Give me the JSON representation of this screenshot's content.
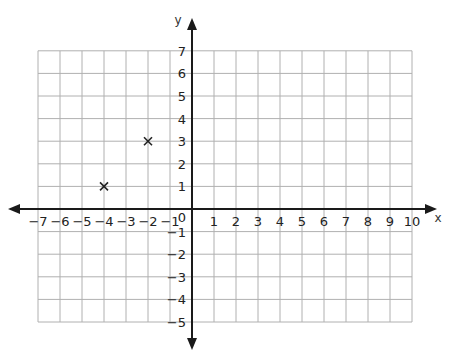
{
  "chart_data": {
    "type": "scatter",
    "title": "",
    "xlabel": "x",
    "ylabel": "y",
    "xlim": [
      -7,
      10
    ],
    "ylim": [
      -5,
      7
    ],
    "grid": true,
    "x_ticks": [
      -7,
      -6,
      -5,
      -4,
      -3,
      -2,
      -1,
      0,
      1,
      2,
      3,
      4,
      5,
      6,
      7,
      8,
      9,
      10
    ],
    "y_ticks": [
      -5,
      -4,
      -3,
      -2,
      -1,
      1,
      2,
      3,
      4,
      5,
      6,
      7
    ],
    "series": [
      {
        "name": "points",
        "marker": "x",
        "points": [
          {
            "x": -4,
            "y": 1
          },
          {
            "x": -2,
            "y": 3
          }
        ]
      }
    ]
  },
  "colors": {
    "grid": "#b0b0b0",
    "axis": "#1a1a1a",
    "marker": "#222222",
    "background": "#ffffff"
  }
}
